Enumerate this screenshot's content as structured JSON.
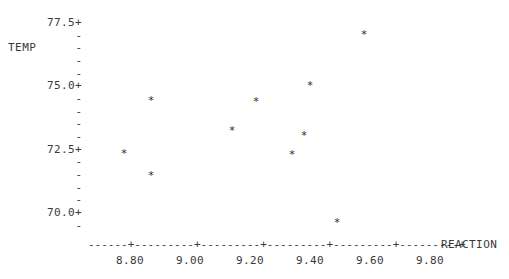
{
  "chart_data": {
    "type": "scatter",
    "title": "",
    "xlabel": "REACTION",
    "ylabel": "TEMP",
    "marker": "*",
    "xlim": [
      8.66,
      9.94
    ],
    "ylim": [
      69.4,
      77.6
    ],
    "grid": false,
    "legend": null,
    "x_ticks": [
      "8.80",
      "9.00",
      "9.20",
      "9.40",
      "9.60",
      "9.80"
    ],
    "x_tick_values": [
      8.8,
      9.0,
      9.2,
      9.4,
      9.6,
      9.8
    ],
    "y_ticks": [
      "77.5",
      "75.0",
      "72.5",
      "70.0"
    ],
    "y_tick_values": [
      77.5,
      75.0,
      72.5,
      70.0
    ],
    "y_minor_count_between": 4,
    "points": [
      {
        "x": 8.78,
        "y": 72.32
      },
      {
        "x": 8.87,
        "y": 74.41
      },
      {
        "x": 8.87,
        "y": 71.45
      },
      {
        "x": 9.14,
        "y": 73.22
      },
      {
        "x": 9.22,
        "y": 74.37
      },
      {
        "x": 9.34,
        "y": 72.3
      },
      {
        "x": 9.38,
        "y": 73.04
      },
      {
        "x": 9.4,
        "y": 75.0
      },
      {
        "x": 9.49,
        "y": 69.59
      },
      {
        "x": 9.58,
        "y": 77.01
      }
    ]
  },
  "axis": {
    "y_title": "TEMP",
    "x_title": "REACTION",
    "y_major_labels": [
      "77.5+",
      "75.0+",
      "72.5+",
      "70.0+"
    ],
    "y_minor_label": "-",
    "x_axis_line": "------+---------+---------+---------+---------+---------+"
  },
  "colors": {
    "background": "#ffffff",
    "text": "#3a3a3a",
    "marker": "#2b2b2b"
  }
}
